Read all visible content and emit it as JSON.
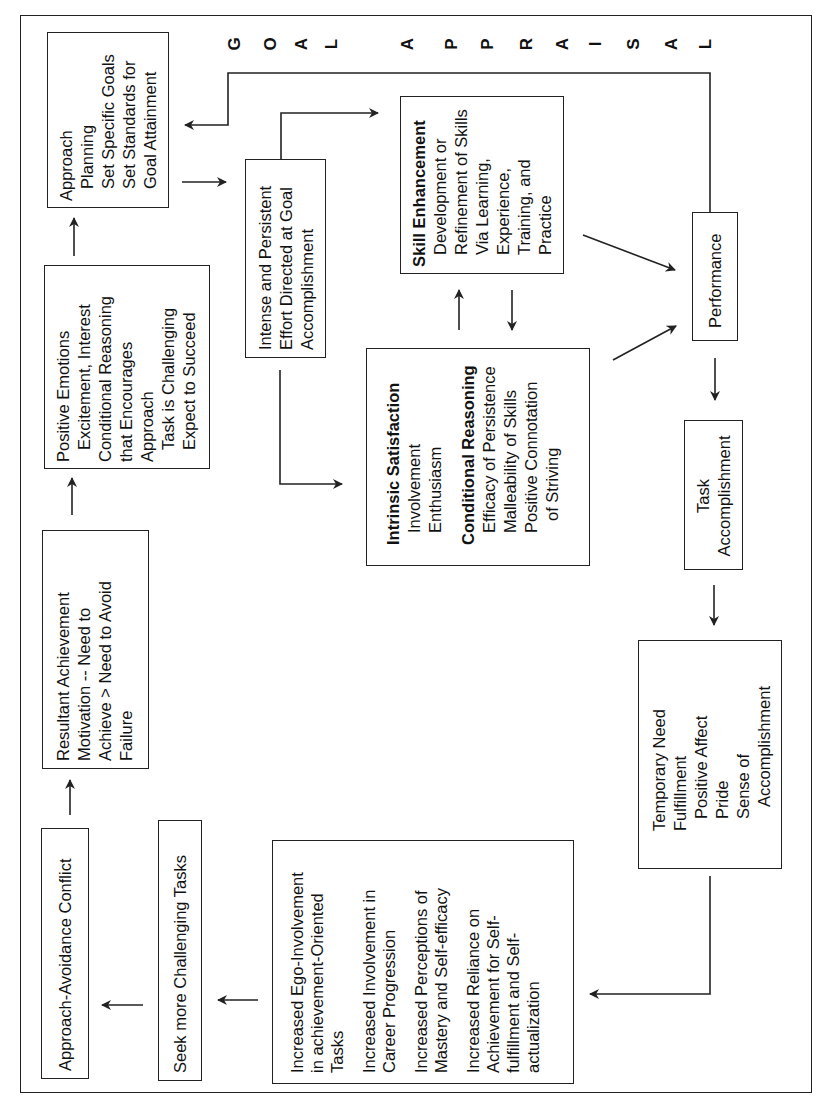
{
  "title": {
    "letters": [
      "G",
      "O",
      "A",
      "L",
      "A",
      "P",
      "P",
      "R",
      "A",
      "I",
      "S",
      "A",
      "L"
    ],
    "text": "GOAL APPRAISAL"
  },
  "boxes": {
    "approach_planning": {
      "lines": [
        "Approach",
        "Planning",
        "Set Specific Goals",
        "Set Standards for",
        "Goal Attainment"
      ]
    },
    "positive_emotions": {
      "lines": [
        "Positive Emotions",
        "Excitement, Interest",
        "Conditional Reasoning",
        "that Encourages",
        "Approach",
        "Task is Challenging",
        "Expect to Succeed"
      ]
    },
    "resultant_achievement": {
      "lines": [
        "Resultant Achievement",
        "Motivation -- Need to",
        "Achieve > Need to Avoid",
        "Failure"
      ]
    },
    "approach_avoidance": {
      "label": "Approach-Avoidance Conflict"
    },
    "seek_challenging": {
      "label": "Seek more Challenging Tasks"
    },
    "increased_outcomes": {
      "lines": [
        "Increased Ego-Involvement",
        "in achievement-Oriented",
        "Tasks",
        "",
        "Increased Involvement in",
        "Career Progression",
        "",
        "Increased Perceptions of",
        "Mastery and Self-efficacy",
        "",
        "Increased Reliance on",
        "Achievement for Self-",
        "fulfillment and Self-",
        "actualization"
      ]
    },
    "intense_effort": {
      "lines": [
        "Intense and Persistent",
        "Effort Directed at Goal",
        "Accomplishment"
      ]
    },
    "skill_enhancement": {
      "heading": "Skill Enhancement",
      "lines": [
        "Development or",
        "Refinement of Skills",
        "Via Learning,",
        "Experience,",
        "Training, and",
        "Practice"
      ]
    },
    "intrinsic_satisfaction": {
      "heading": "Intrinsic Satisfaction",
      "lines": [
        "Involvement",
        "Enthusiasm"
      ],
      "heading2": "Conditional Reasoning",
      "lines2": [
        "Efficacy of Persistence",
        "Malleability of Skills",
        "Positive Connotation",
        "of Striving"
      ]
    },
    "performance": {
      "label": "Performance"
    },
    "task_accomplishment": {
      "lines": [
        "Task",
        "Accomplishment"
      ]
    },
    "temporary_need": {
      "lines": [
        "Temporary Need",
        "Fulfillment",
        "Positive Affect",
        "Pride",
        "Sense of",
        "Accomplishment"
      ]
    }
  },
  "colors": {
    "line": "#222222",
    "background": "#ffffff",
    "text": "#111111"
  }
}
